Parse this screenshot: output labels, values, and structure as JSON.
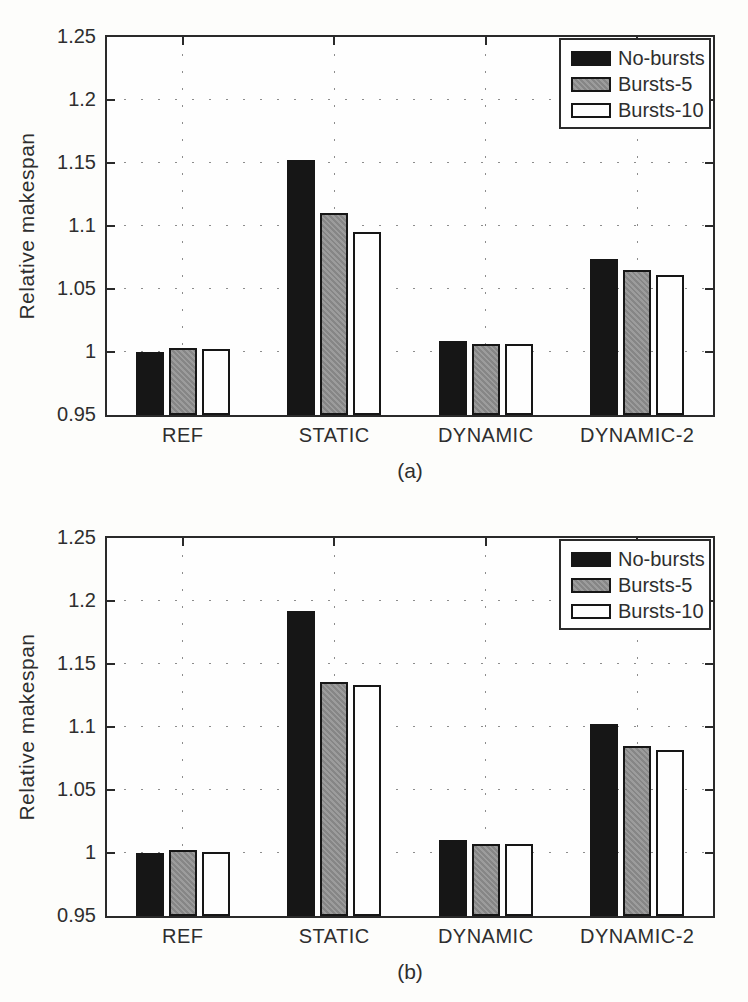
{
  "figure": {
    "background": "#fdfdfb",
    "axis_color": "#2a2a2a"
  },
  "chart_data": [
    {
      "type": "bar",
      "caption": "(a)",
      "ylabel": "Relative makespan",
      "xlabel": "",
      "categories": [
        "REF",
        "STATIC",
        "DYNAMIC",
        "DYNAMIC-2"
      ],
      "series": [
        {
          "name": "No-bursts",
          "color": "#161616",
          "pattern": "solid",
          "values": [
            1.0,
            1.152,
            1.009,
            1.074
          ]
        },
        {
          "name": "Bursts-5",
          "color": "#9c9c9c",
          "pattern": "halftone",
          "values": [
            1.003,
            1.11,
            1.006,
            1.065
          ]
        },
        {
          "name": "Bursts-10",
          "color": "#fefefe",
          "pattern": "solid",
          "values": [
            1.002,
            1.095,
            1.006,
            1.061
          ]
        }
      ],
      "ylim": [
        0.95,
        1.25
      ],
      "yticks": [
        {
          "label": "0.95",
          "value": 0.95
        },
        {
          "label": "1",
          "value": 1.0
        },
        {
          "label": "1.05",
          "value": 1.05
        },
        {
          "label": "1.1",
          "value": 1.1
        },
        {
          "label": "1.15",
          "value": 1.15
        },
        {
          "label": "1.2",
          "value": 1.2
        },
        {
          "label": "1.25",
          "value": 1.25
        }
      ],
      "grid": true,
      "legend_position": "top-right"
    },
    {
      "type": "bar",
      "caption": "(b)",
      "ylabel": "Relative makespan",
      "xlabel": "",
      "categories": [
        "REF",
        "STATIC",
        "DYNAMIC",
        "DYNAMIC-2"
      ],
      "series": [
        {
          "name": "No-bursts",
          "color": "#161616",
          "pattern": "solid",
          "values": [
            1.0,
            1.192,
            1.01,
            1.102
          ]
        },
        {
          "name": "Bursts-5",
          "color": "#9c9c9c",
          "pattern": "halftone",
          "values": [
            1.002,
            1.136,
            1.007,
            1.085
          ]
        },
        {
          "name": "Bursts-10",
          "color": "#fefefe",
          "pattern": "solid",
          "values": [
            1.001,
            1.133,
            1.007,
            1.082
          ]
        }
      ],
      "ylim": [
        0.95,
        1.25
      ],
      "yticks": [
        {
          "label": "0.95",
          "value": 0.95
        },
        {
          "label": "1",
          "value": 1.0
        },
        {
          "label": "1.05",
          "value": 1.05
        },
        {
          "label": "1.1",
          "value": 1.1
        },
        {
          "label": "1.15",
          "value": 1.15
        },
        {
          "label": "1.2",
          "value": 1.2
        },
        {
          "label": "1.25",
          "value": 1.25
        }
      ],
      "grid": true,
      "legend_position": "top-right"
    }
  ]
}
